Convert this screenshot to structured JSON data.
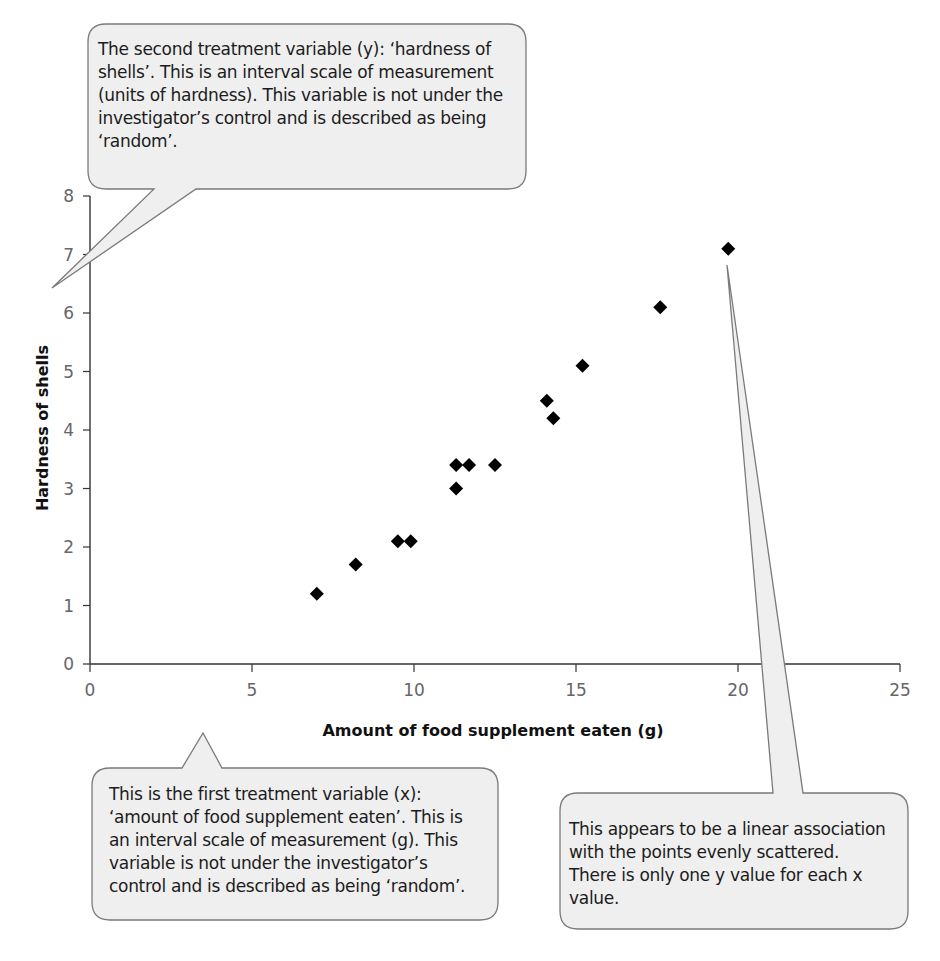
{
  "chart_data": {
    "type": "scatter",
    "title": "",
    "xlabel": "Amount of food supplement eaten (g)",
    "ylabel": "Hardness of shells",
    "xlim": [
      0,
      25
    ],
    "ylim": [
      0,
      8
    ],
    "xticks": [
      0,
      5,
      10,
      15,
      20,
      25
    ],
    "yticks": [
      0,
      1,
      2,
      3,
      4,
      5,
      6,
      7,
      8
    ],
    "grid": false,
    "legend": null,
    "marker": "diamond",
    "series": [
      {
        "name": "observations",
        "points": [
          {
            "x": 7.0,
            "y": 1.2
          },
          {
            "x": 8.2,
            "y": 1.7
          },
          {
            "x": 9.5,
            "y": 2.1
          },
          {
            "x": 9.9,
            "y": 2.1
          },
          {
            "x": 11.3,
            "y": 3.0
          },
          {
            "x": 11.3,
            "y": 3.4
          },
          {
            "x": 11.7,
            "y": 3.4
          },
          {
            "x": 12.5,
            "y": 3.4
          },
          {
            "x": 14.1,
            "y": 4.5
          },
          {
            "x": 14.3,
            "y": 4.2
          },
          {
            "x": 15.2,
            "y": 5.1
          },
          {
            "x": 17.6,
            "y": 6.1
          },
          {
            "x": 19.7,
            "y": 7.1
          }
        ]
      }
    ],
    "annotations": [
      "The second treatment variable (y): ‘hardness of shells’. This is an interval scale of measurement (units of hardness). This variable is not under the investigator’s control and is described as being ‘random’.",
      "This is the first treatment variable (x): ‘amount of food supplement eaten’. This is an interval scale of measurement (g). This variable is not under the investigator’s control and is described as being ‘random’.",
      "This appears to be a linear association with the points evenly scattered. There is only one y value for each x value."
    ]
  },
  "callouts": {
    "y_variable": {
      "lines": [
        "The second treatment variable (y): ‘hardness of",
        "shells’. This is an interval scale of measurement",
        "(units of hardness). This variable is not under the",
        "investigator’s control and is described as being",
        "‘random’."
      ]
    },
    "x_variable": {
      "lines": [
        "This is the first treatment variable (x):",
        "‘amount of food supplement eaten’. This is",
        "an interval scale of measurement (g). This",
        "variable is not under the investigator’s",
        "control and is described as being ‘random’."
      ]
    },
    "association": {
      "lines": [
        "This appears to be a linear association",
        "with the points evenly scattered.",
        "There is only one y value for each x",
        "value."
      ]
    }
  },
  "colors": {
    "marker": "#000000",
    "axis": "#333333",
    "callout_fill": "#eeeeee",
    "callout_stroke": "#777777"
  }
}
